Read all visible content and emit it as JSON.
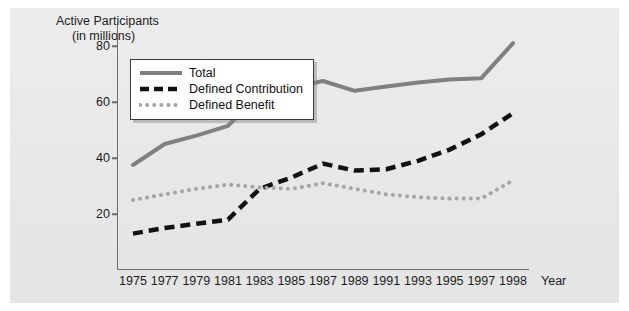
{
  "chart_data": {
    "type": "line",
    "title": "Active Participants (in millions)",
    "title_lines": [
      "Active Participants",
      "(in millions)"
    ],
    "xlabel": "Year",
    "ylabel": "",
    "x": [
      1975,
      1977,
      1979,
      1981,
      1983,
      1985,
      1987,
      1989,
      1991,
      1993,
      1995,
      1997,
      1998
    ],
    "categories": [
      "1975",
      "1977",
      "1979",
      "1981",
      "1983",
      "1985",
      "1987",
      "1989",
      "1991",
      "1993",
      "1995",
      "1997",
      "1998"
    ],
    "ytick_labels": [
      "20",
      "40",
      "60",
      "80"
    ],
    "ytick_values": [
      20,
      40,
      60,
      80
    ],
    "ylim": [
      0,
      90
    ],
    "xlim": [
      1975,
      1998
    ],
    "grid": false,
    "legend_position": "upper-left-inside",
    "series": [
      {
        "name": "Total",
        "style": "solid",
        "color": "#808080",
        "values": [
          37.5,
          45.0,
          48.0,
          51.5,
          62.5,
          65.0,
          67.5,
          64.0,
          65.5,
          67.0,
          68.0,
          68.5,
          81.0
        ]
      },
      {
        "name": "Defined Contribution",
        "style": "dashed",
        "color": "#111111",
        "values": [
          13.0,
          15.0,
          16.5,
          18.0,
          29.0,
          33.0,
          38.0,
          35.5,
          36.0,
          39.0,
          43.0,
          48.5,
          56.0
        ]
      },
      {
        "name": "Defined Benefit",
        "style": "dotted",
        "color": "#a6a6a6",
        "values": [
          25.0,
          27.0,
          29.0,
          30.5,
          29.5,
          29.0,
          31.0,
          29.0,
          27.0,
          26.0,
          25.5,
          25.5,
          32.0
        ]
      }
    ]
  },
  "legend": {
    "items": [
      {
        "label": "Total",
        "style": "solid",
        "color": "#808080"
      },
      {
        "label": "Defined Contribution",
        "style": "dashed",
        "color": "#111111"
      },
      {
        "label": "Defined Benefit",
        "style": "dotted",
        "color": "#a6a6a6"
      }
    ]
  },
  "axes": {
    "x_title": "Year"
  }
}
